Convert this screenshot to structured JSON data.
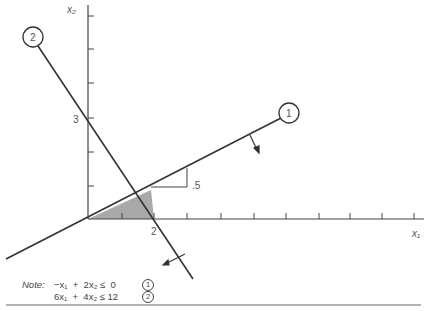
{
  "axes": {
    "x_label": "x₁",
    "y_label": "x₂",
    "x_tick_label": "2",
    "y_tick_label": "3"
  },
  "constraints": [
    {
      "id": "1",
      "label": "1",
      "expression": "−x₁ + 2x₂ ≤ 0"
    },
    {
      "id": "2",
      "label": "2",
      "expression": "6x₁ + 4x₂ ≤ 12"
    }
  ],
  "slope_annotation": ".5",
  "note": {
    "prefix": "Note:",
    "lines": [
      {
        "text": "−x₁  +  2x₂ ≤  0",
        "marker": "1"
      },
      {
        "text": "6x₁  +  4x₂ ≤ 12",
        "marker": "2"
      }
    ]
  },
  "colors": {
    "line": "#333333",
    "feasible_region": "#a9a9a9",
    "text": "#555555"
  }
}
